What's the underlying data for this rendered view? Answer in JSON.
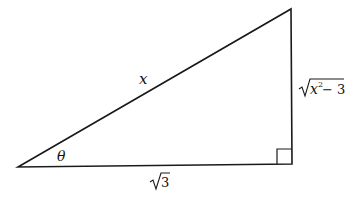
{
  "diagram": {
    "type": "right-triangle",
    "hypotenuse_label": "x",
    "opposite_label_radicand": "x",
    "opposite_label_exponent": "2",
    "opposite_label_rest": " − 3",
    "adjacent_label_radicand": "3",
    "angle_label": "θ",
    "stroke_color": "#1a1a1a",
    "background": "#ffffff"
  }
}
